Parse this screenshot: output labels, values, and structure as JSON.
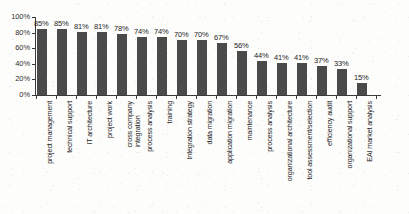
{
  "chart_data": {
    "type": "bar",
    "title": "",
    "xlabel": "",
    "ylabel": "",
    "ylim": [
      0,
      100
    ],
    "yticks": [
      "0%",
      "20%",
      "40%",
      "60%",
      "80%",
      "100%"
    ],
    "ytick_values": [
      0,
      20,
      40,
      60,
      80,
      100
    ],
    "grid": false,
    "legend": false,
    "bar_color": "#4a4a4a",
    "axis_color": "#3a3a3a",
    "value_suffix": "%",
    "categories": [
      "project management",
      "technical support",
      "IT architecture",
      "project work",
      "cross company integration",
      "process analysis",
      "training",
      "Integration strategy",
      "data migration",
      "application migration",
      "maintenance",
      "process analysis",
      "organizational architecture",
      "tool assessment/selection",
      "efficiency audit",
      "organizational support",
      "EAI market analysis"
    ],
    "category_lines": [
      [
        "project management"
      ],
      [
        "technical support"
      ],
      [
        "IT architecture"
      ],
      [
        "project work"
      ],
      [
        "cross company",
        "integration"
      ],
      [
        "process analysis"
      ],
      [
        "training"
      ],
      [
        "Integration strategy"
      ],
      [
        "data migration"
      ],
      [
        "application migration"
      ],
      [
        "maintenance"
      ],
      [
        "process analysis"
      ],
      [
        "organizational architecture"
      ],
      [
        "tool assessment/selection"
      ],
      [
        "efficiency audit"
      ],
      [
        "organizational support"
      ],
      [
        "EAI market analysis"
      ]
    ],
    "values": [
      85,
      85,
      81,
      81,
      78,
      74,
      74,
      70,
      70,
      67,
      56,
      44,
      41,
      41,
      37,
      33,
      15
    ],
    "value_labels": [
      "85%",
      "85%",
      "81%",
      "81%",
      "78%",
      "74%",
      "74%",
      "70%",
      "70%",
      "67%",
      "56%",
      "44%",
      "41%",
      "41%",
      "37%",
      "33%",
      "15%"
    ]
  }
}
